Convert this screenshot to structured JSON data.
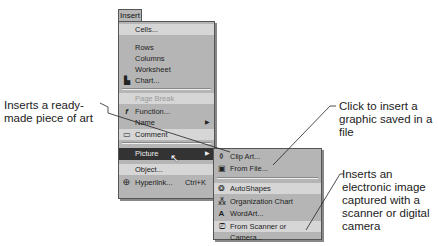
{
  "menu_bar": {
    "active_menu": "Insert"
  },
  "insert_menu": {
    "items": [
      {
        "label": "Cells...",
        "icon": "",
        "shortcut": "",
        "submenu": false,
        "state": "normal"
      },
      {
        "label": "Rows",
        "icon": "",
        "shortcut": "",
        "submenu": false,
        "state": "normal"
      },
      {
        "label": "Columns",
        "icon": "",
        "shortcut": "",
        "submenu": false,
        "state": "normal"
      },
      {
        "label": "Worksheet",
        "icon": "",
        "shortcut": "",
        "submenu": false,
        "state": "normal"
      },
      {
        "label": "Chart...",
        "icon": "chart-icon",
        "shortcut": "",
        "submenu": false,
        "state": "normal"
      },
      {
        "label": "Page Break",
        "icon": "",
        "shortcut": "",
        "submenu": false,
        "state": "disabled"
      },
      {
        "label": "Function...",
        "icon": "function-icon",
        "shortcut": "",
        "submenu": false,
        "state": "normal"
      },
      {
        "label": "Name",
        "icon": "",
        "shortcut": "",
        "submenu": true,
        "state": "normal"
      },
      {
        "label": "Comment",
        "icon": "comment-icon",
        "shortcut": "",
        "submenu": false,
        "state": "normal"
      },
      {
        "label": "Picture",
        "icon": "",
        "shortcut": "",
        "submenu": true,
        "state": "highlighted"
      },
      {
        "label": "Object...",
        "icon": "",
        "shortcut": "",
        "submenu": false,
        "state": "normal"
      },
      {
        "label": "Hyperlink...",
        "icon": "hyperlink-icon",
        "shortcut": "Ctrl+K",
        "submenu": false,
        "state": "normal"
      }
    ]
  },
  "picture_submenu": {
    "items": [
      {
        "label": "Clip Art...",
        "icon": "clip-art-icon"
      },
      {
        "label": "From File...",
        "icon": "from-file-icon"
      },
      {
        "label": "AutoShapes",
        "icon": "autoshapes-icon"
      },
      {
        "label": "Organization Chart",
        "icon": "org-chart-icon"
      },
      {
        "label": "WordArt...",
        "icon": "wordart-icon"
      },
      {
        "label": "From Scanner or Camera...",
        "icon": "scanner-icon"
      }
    ]
  },
  "callouts": {
    "clip_art": "Inserts a ready-made piece of art",
    "from_file": "Click to insert a graphic saved in a file",
    "scanner": "Inserts an electronic image captured with a scanner or digital camera"
  },
  "colors": {
    "menu_bg": "#b5b5b5",
    "highlight_bg": "#333333",
    "text": "#222222"
  }
}
